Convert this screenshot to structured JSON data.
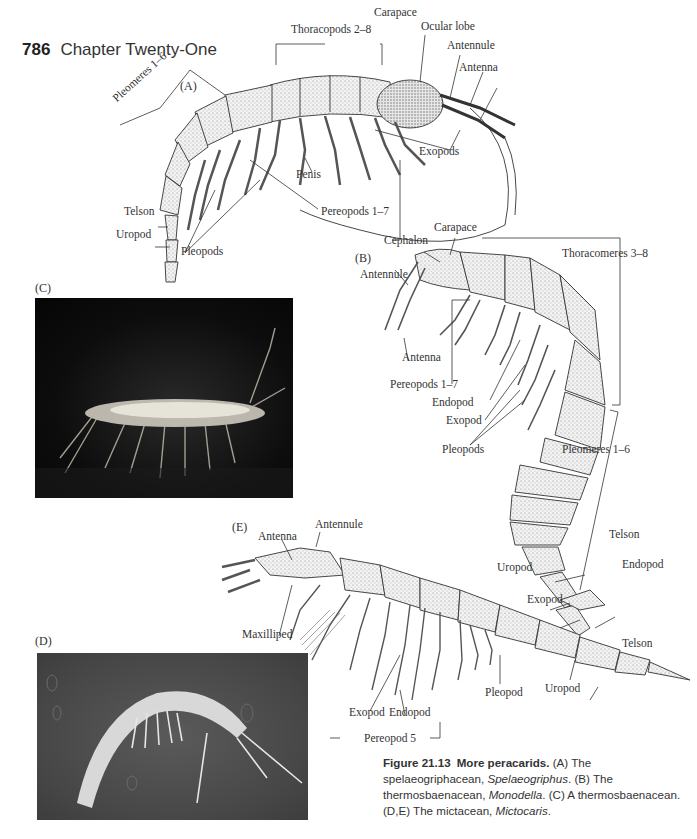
{
  "page": {
    "page_number": "786",
    "chapter_title": "Chapter Twenty-One"
  },
  "figure": {
    "panel_A": {
      "letter": "(A)",
      "labels": {
        "thoracopods": "Thoracopods 2–8",
        "carapace": "Carapace",
        "ocular_lobe": "Ocular lobe",
        "antennule": "Antennule",
        "antenna": "Antenna",
        "pleomeres": "Pleomeres 1–6",
        "exopods": "Exopods",
        "penis": "Penis",
        "pereopods": "Pereopods 1–7",
        "telson": "Telson",
        "uropod": "Uropod",
        "pleopods": "Pleopods"
      }
    },
    "panel_B": {
      "letter": "(B)",
      "labels": {
        "carapace": "Carapace",
        "cephalon": "Cephalon",
        "thoracomeres": "Thoracomeres 3–8",
        "antennule": "Antennule",
        "antenna": "Antenna",
        "pereopods": "Pereopods 1–7",
        "endopod": "Endopod",
        "exopod": "Exopod",
        "pleopods": "Pleopods",
        "pleomeres": "Pleomeres 1–6",
        "telson": "Telson",
        "uropod": "Uropod",
        "endopod_tail": "Endopod",
        "exopod_tail": "Exopod"
      }
    },
    "panel_C": {
      "letter": "(C)"
    },
    "panel_D": {
      "letter": "(D)"
    },
    "panel_E": {
      "letter": "(E)",
      "labels": {
        "antenna": "Antenna",
        "antennule": "Antennule",
        "maxilliped": "Maxilliped",
        "telson": "Telson",
        "pleopod": "Pleopod",
        "uropod": "Uropod",
        "exopod": "Exopod",
        "endopod": "Endopod",
        "pereopod": "Pereopod 5"
      }
    },
    "caption": {
      "label": "Figure 21.13",
      "title": "More peracarids.",
      "part1": " (A) The spelaeogriphacean, ",
      "genus1": "Spelaeogriphus",
      "part2": ". (B) The thermosbaenacean, ",
      "genus2": "Monodella",
      "part3": ". (C) A thermosbaenacean. (D,E) The mictacean, ",
      "genus3": "Mictocaris",
      "part4": "."
    }
  }
}
